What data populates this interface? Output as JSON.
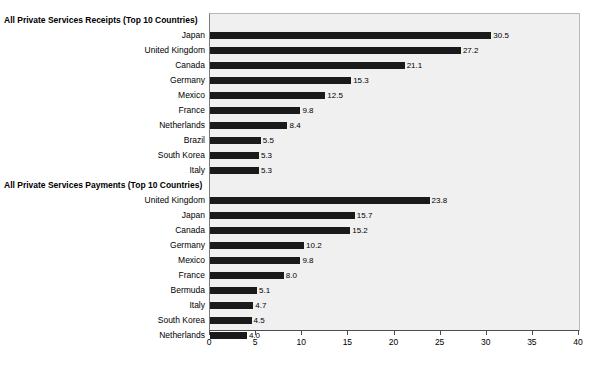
{
  "chart_data": {
    "type": "bar",
    "orientation": "horizontal",
    "title": "",
    "xlabel": "",
    "ylabel": "",
    "xlim": [
      0,
      40
    ],
    "xticks": [
      "0",
      "5",
      "10",
      "15",
      "20",
      "25",
      "30",
      "35",
      "40"
    ],
    "grid": false,
    "legend": null,
    "panels": [
      {
        "title": "All Private Services Receipts (Top 10 Countries)",
        "categories": [
          "Japan",
          "United Kingdom",
          "Canada",
          "Germany",
          "Mexico",
          "France",
          "Netherlands",
          "Brazil",
          "South Korea",
          "Italy"
        ],
        "values": [
          30.5,
          27.2,
          21.1,
          15.3,
          12.5,
          9.8,
          8.4,
          5.5,
          5.3,
          5.3
        ],
        "labels": [
          "30.5",
          "27.2",
          "21.1",
          "15.3",
          "12.5",
          "9.8",
          "8.4",
          "5.5",
          "5.3",
          "5.3"
        ]
      },
      {
        "title": "All Private Services Payments (Top 10 Countries)",
        "categories": [
          "United Kingdom",
          "Japan",
          "Canada",
          "Germany",
          "Mexico",
          "France",
          "Bermuda",
          "Italy",
          "South Korea",
          "Netherlands"
        ],
        "values": [
          23.8,
          15.7,
          15.2,
          10.2,
          9.8,
          8.0,
          5.1,
          4.7,
          4.5,
          4.0
        ],
        "labels": [
          "23.8",
          "15.7",
          "15.2",
          "10.2",
          "9.8",
          "8.0",
          "5.1",
          "4.7",
          "4.5",
          "4.0"
        ]
      }
    ]
  },
  "colors": {
    "bar": "#1a1a1a",
    "plot_background": "#f0f0f0",
    "axis": "#4d4d4d",
    "text": "#000000",
    "page_background": "#ffffff"
  }
}
